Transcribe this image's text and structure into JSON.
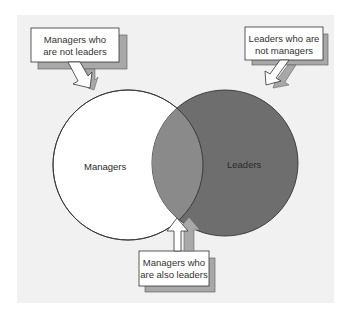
{
  "diagram": {
    "type": "venn",
    "sets": [
      {
        "id": "managers",
        "label": "Managers",
        "fill": "#ffffff"
      },
      {
        "id": "leaders",
        "label": "Leaders",
        "fill": "#6e6e6e"
      }
    ],
    "intersection": {
      "fill": "#8a8a8a"
    },
    "callouts": [
      {
        "id": "managers-only",
        "lines": [
          "Managers who",
          "are not leaders"
        ]
      },
      {
        "id": "leaders-only",
        "lines": [
          "Leaders who are",
          "not managers"
        ]
      },
      {
        "id": "both",
        "lines": [
          "Managers who",
          "are also leaders"
        ]
      }
    ],
    "colors": {
      "panel": "#f1f1f1",
      "outline": "#333333",
      "shadow": "#a8a8a8",
      "box": "#ffffff"
    }
  }
}
